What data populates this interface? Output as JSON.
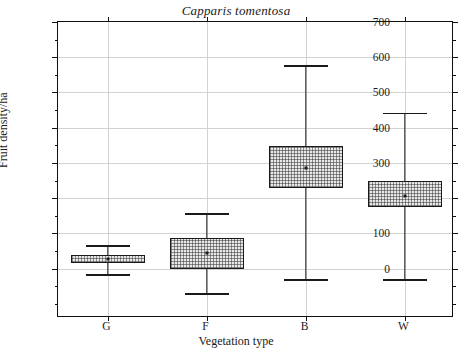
{
  "chart_data": {
    "type": "box",
    "title": "Capparis tomentosa",
    "xlabel": "Vegetation type",
    "ylabel": "Fruit density/ha",
    "categories": [
      "G",
      "F",
      "B",
      "W"
    ],
    "ylim": [
      -140,
      700
    ],
    "yticks": [
      0,
      100,
      200,
      300,
      400,
      500,
      600,
      700
    ],
    "ytick_labels": [
      "0",
      "100",
      "200",
      "300",
      "400",
      "500",
      "600",
      "700"
    ],
    "yminor_step": 50,
    "grid": "horizontal-and-vertical",
    "legend": null,
    "boxes": [
      {
        "name": "G",
        "whisker_low": -15,
        "q1": 15,
        "median": 28,
        "q3": 38,
        "whisker_high": 67
      },
      {
        "name": "F",
        "whisker_low": -70,
        "q1": 0,
        "median": 45,
        "q3": 88,
        "whisker_high": 158
      },
      {
        "name": "B",
        "whisker_low": -30,
        "q1": 228,
        "median": 285,
        "q3": 348,
        "whisker_high": 578
      },
      {
        "name": "W",
        "whisker_low": -30,
        "q1": 175,
        "median": 205,
        "q3": 250,
        "whisker_high": 443
      }
    ]
  },
  "axis": {
    "y_title": "Fruit density/ha",
    "x_title": "Vegetation type"
  },
  "colors": {
    "frame": "#111111",
    "grid": "#d2d2d2",
    "box_fill": "#e8e8e8",
    "ink": "#1a1a1a"
  }
}
